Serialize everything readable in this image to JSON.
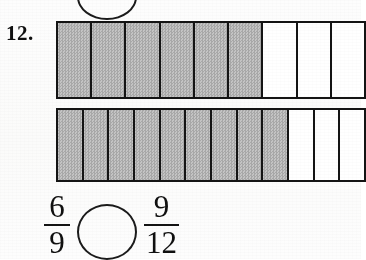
{
  "worksheet": {
    "problem_number": "12.",
    "instruction_visible": false
  },
  "top_partial_circle": {
    "name": "answer-circle-previous-problem",
    "shape": "circle",
    "clipped": "top"
  },
  "bars": [
    {
      "id": "bar-top",
      "label": "fraction-bar-top",
      "total_segments_visible": 9,
      "shaded_segments": 6,
      "unshaded_segments": 3,
      "represents": "6/9",
      "clipped_right": true
    },
    {
      "id": "bar-bottom",
      "label": "fraction-bar-bottom",
      "total_segments_visible": 12,
      "shaded_segments": 9,
      "unshaded_segments": 3,
      "represents": "9/12",
      "clipped_right": true
    }
  ],
  "expression": {
    "left_fraction": {
      "numerator": "6",
      "denominator": "9"
    },
    "comparison_placeholder": "",
    "right_fraction": {
      "numerator": "9",
      "denominator": "12"
    }
  },
  "colors": {
    "ink": "#141414",
    "shaded_fill": "#b4b4b4",
    "unshaded_fill": "#ffffff",
    "paper": "#fdfdfd"
  }
}
